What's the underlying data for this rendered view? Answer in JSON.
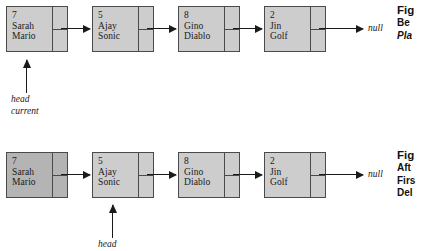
{
  "figure": {
    "background_color": "#ffffff",
    "node_fill_light": "#cdcdcd",
    "node_fill_dark": "#b4b4b4",
    "stroke_color": "#4a4a4a",
    "arrow_color": "#1a1a1a"
  },
  "diagrams": [
    {
      "id": "before-deletion",
      "nodes": [
        {
          "key": "7",
          "first_name": "Sarah",
          "last_name": "Mario",
          "shade": "shade-light"
        },
        {
          "key": "5",
          "first_name": "Ajay",
          "last_name": "Sonic",
          "shade": "shade-light"
        },
        {
          "key": "8",
          "first_name": "Gino",
          "last_name": "Diablo",
          "shade": "shade-light"
        },
        {
          "key": "2",
          "first_name": "Jin",
          "last_name": "Golf",
          "shade": "shade-light"
        }
      ],
      "terminator": "null",
      "pointers": [
        {
          "label_1": "head",
          "label_2": "current",
          "target_node": 0
        }
      ]
    },
    {
      "id": "after-deletion",
      "nodes": [
        {
          "key": "7",
          "first_name": "Sarah",
          "last_name": "Mario",
          "shade": "shade-dark"
        },
        {
          "key": "5",
          "first_name": "Ajay",
          "last_name": "Sonic",
          "shade": "shade-light"
        },
        {
          "key": "8",
          "first_name": "Gino",
          "last_name": "Diablo",
          "shade": "shade-light"
        },
        {
          "key": "2",
          "first_name": "Jin",
          "last_name": "Golf",
          "shade": "shade-light"
        }
      ],
      "terminator": "null",
      "pointers": [
        {
          "label_1": "head",
          "label_2": "",
          "target_node": 1
        }
      ]
    }
  ],
  "captions": [
    {
      "id": "caption-top",
      "title": "Fig",
      "lines": [
        "Be",
        "Pla"
      ]
    },
    {
      "id": "caption-bottom",
      "title": "Fig",
      "lines": [
        "Aft",
        "Firs",
        "Del"
      ]
    }
  ]
}
